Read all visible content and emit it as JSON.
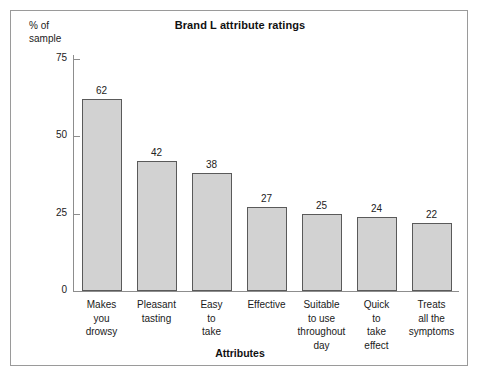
{
  "chart_data": {
    "type": "bar",
    "title": "Brand L attribute ratings",
    "xlabel": "Attributes",
    "ylabel": "% of\nsample",
    "ylim": [
      0,
      75
    ],
    "yticks": [
      0,
      25,
      50,
      75
    ],
    "ytick_labels": [
      "0",
      "25",
      "50",
      "75"
    ],
    "grid": false,
    "legend": false,
    "categories": [
      "Makes\nyou\ndrowsy",
      "Pleasant\ntasting",
      "Easy\nto\ntake",
      "Effective",
      "Suitable\nto use\nthroughout\nday",
      "Quick\nto\ntake\neffect",
      "Treats\nall the\nsymptoms"
    ],
    "values": [
      62,
      42,
      38,
      27,
      25,
      24,
      22
    ],
    "value_labels": [
      "62",
      "42",
      "38",
      "27",
      "25",
      "24",
      "22"
    ],
    "bar_fill_color": "#d2d2d2",
    "bar_border_color": "#5a5a5a",
    "axis_color": "#8d8d8d",
    "frame_color": "#9a9a9a",
    "text_color": "#1a1a1a"
  }
}
